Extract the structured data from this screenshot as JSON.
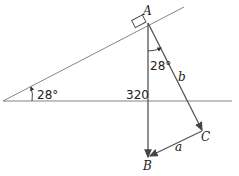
{
  "diagram": {
    "points": {
      "A": "A",
      "B": "B",
      "C": "C"
    },
    "vectors": {
      "a": "a",
      "b": "b"
    },
    "angle_incline": "28°",
    "angle_at_A": "28°",
    "weight": "320",
    "colors": {
      "line": "#444444",
      "vector": "#555555",
      "arrow": "#333333"
    }
  }
}
